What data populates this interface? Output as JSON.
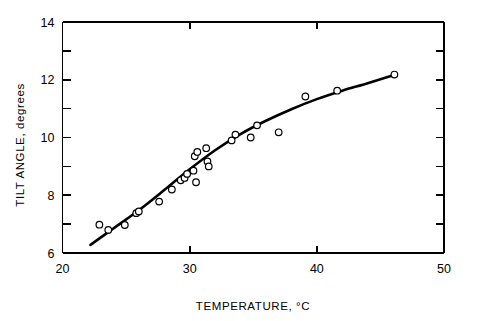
{
  "chart_data": {
    "type": "scatter",
    "title": "",
    "xlabel": "TEMPERATURE, °C",
    "ylabel": "TILT ANGLE, degrees",
    "xlim": [
      20,
      50
    ],
    "ylim": [
      6,
      14
    ],
    "grid": false,
    "legend": "none",
    "x_major_ticks": [
      20,
      30,
      40,
      50
    ],
    "x_major_tick_labels": [
      "20",
      "30",
      "40",
      "50"
    ],
    "y_major_ticks": [
      6,
      8,
      10,
      12,
      14
    ],
    "y_major_tick_labels": [
      "6",
      "8",
      "10",
      "12",
      "14"
    ],
    "y_minor_ticks": [
      7,
      9,
      11,
      13
    ],
    "marker": "open-circle",
    "marker_edge_color": "#000000",
    "marker_face_color": "#ffffff",
    "line_color": "#000000",
    "axis_color": "#000000",
    "series": [
      {
        "name": "measured points",
        "type": "scatter",
        "points": [
          [
            22.9,
            6.98
          ],
          [
            23.6,
            6.8
          ],
          [
            24.9,
            6.97
          ],
          [
            25.8,
            7.38
          ],
          [
            26.0,
            7.44
          ],
          [
            27.6,
            7.78
          ],
          [
            28.6,
            8.2
          ],
          [
            29.3,
            8.52
          ],
          [
            29.6,
            8.6
          ],
          [
            29.8,
            8.74
          ],
          [
            30.3,
            8.85
          ],
          [
            30.5,
            8.45
          ],
          [
            30.4,
            9.35
          ],
          [
            30.6,
            9.5
          ],
          [
            31.3,
            9.63
          ],
          [
            31.4,
            9.17
          ],
          [
            31.5,
            9.0
          ],
          [
            33.3,
            9.9
          ],
          [
            33.6,
            10.1
          ],
          [
            35.3,
            10.42
          ],
          [
            34.8,
            10.0
          ],
          [
            37.0,
            10.18
          ],
          [
            39.1,
            11.42
          ],
          [
            41.6,
            11.62
          ],
          [
            46.1,
            12.18
          ]
        ]
      },
      {
        "name": "fitted curve",
        "type": "line",
        "points": [
          [
            22.2,
            6.28
          ],
          [
            24.0,
            6.85
          ],
          [
            26.0,
            7.48
          ],
          [
            28.0,
            8.18
          ],
          [
            30.0,
            8.9
          ],
          [
            32.0,
            9.56
          ],
          [
            34.0,
            10.12
          ],
          [
            36.0,
            10.58
          ],
          [
            38.0,
            10.98
          ],
          [
            40.0,
            11.33
          ],
          [
            42.0,
            11.62
          ],
          [
            44.0,
            11.88
          ],
          [
            46.2,
            12.18
          ]
        ]
      }
    ]
  }
}
